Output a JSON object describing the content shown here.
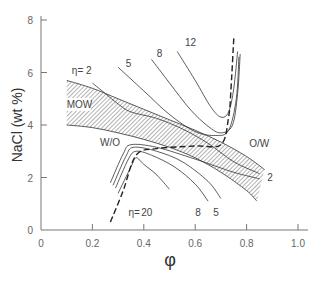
{
  "chart_data": {
    "type": "line",
    "title": "",
    "xlabel": "φ",
    "ylabel": "NaCl (wt %)",
    "xlim": [
      0,
      1.0
    ],
    "ylim": [
      0,
      8
    ],
    "grid": false,
    "x_ticks": [
      "0",
      "0.2",
      "0.4",
      "0.6",
      "0.8",
      "1.0"
    ],
    "y_ticks": [
      "0",
      "2",
      "4",
      "6",
      "8"
    ],
    "regions": [
      {
        "name": "MOW",
        "type": "hatched-band",
        "upper": [
          [
            0.1,
            5.7
          ],
          [
            0.2,
            5.4
          ],
          [
            0.3,
            5.0
          ],
          [
            0.4,
            4.6
          ],
          [
            0.5,
            4.2
          ],
          [
            0.6,
            3.8
          ],
          [
            0.7,
            3.35
          ],
          [
            0.8,
            2.8
          ],
          [
            0.87,
            2.3
          ]
        ],
        "lower": [
          [
            0.1,
            4.0
          ],
          [
            0.2,
            3.9
          ],
          [
            0.3,
            3.7
          ],
          [
            0.4,
            3.45
          ],
          [
            0.5,
            3.15
          ],
          [
            0.6,
            2.75
          ],
          [
            0.7,
            2.2
          ],
          [
            0.8,
            1.5
          ],
          [
            0.84,
            1.1
          ]
        ]
      }
    ],
    "series": [
      {
        "name": "η=2 (upper)",
        "eta": 2,
        "points": [
          [
            0.2,
            5.6
          ],
          [
            0.25,
            5.2
          ],
          [
            0.3,
            4.8
          ],
          [
            0.35,
            4.5
          ],
          [
            0.45,
            4.25
          ],
          [
            0.55,
            3.85
          ],
          [
            0.65,
            3.3
          ],
          [
            0.75,
            2.6
          ],
          [
            0.85,
            2.15
          ]
        ]
      },
      {
        "name": "η=5 (upper)",
        "eta": 5,
        "points": [
          [
            0.3,
            6.2
          ],
          [
            0.4,
            5.3
          ],
          [
            0.5,
            4.4
          ],
          [
            0.6,
            3.75
          ],
          [
            0.68,
            3.6
          ],
          [
            0.73,
            3.8
          ],
          [
            0.76,
            5.0
          ],
          [
            0.77,
            6.6
          ]
        ]
      },
      {
        "name": "η=8 (upper)",
        "eta": 8,
        "points": [
          [
            0.43,
            6.5
          ],
          [
            0.5,
            5.6
          ],
          [
            0.58,
            4.6
          ],
          [
            0.65,
            3.95
          ],
          [
            0.7,
            3.7
          ],
          [
            0.745,
            4.0
          ],
          [
            0.765,
            5.2
          ],
          [
            0.775,
            6.7
          ]
        ]
      },
      {
        "name": "η=12 (upper)",
        "eta": 12,
        "points": [
          [
            0.53,
            6.8
          ],
          [
            0.6,
            5.7
          ],
          [
            0.66,
            4.7
          ],
          [
            0.7,
            4.3
          ],
          [
            0.73,
            4.5
          ],
          [
            0.75,
            5.4
          ],
          [
            0.765,
            6.8
          ]
        ]
      },
      {
        "name": "η=20 (lower)",
        "eta": 20,
        "points": [
          [
            0.3,
            1.4
          ],
          [
            0.35,
            2.4
          ],
          [
            0.37,
            2.75
          ],
          [
            0.4,
            2.5
          ],
          [
            0.45,
            2.1
          ],
          [
            0.5,
            1.55
          ]
        ]
      },
      {
        "name": "η=8 (lower)",
        "eta": 8,
        "points": [
          [
            0.29,
            1.6
          ],
          [
            0.34,
            2.7
          ],
          [
            0.37,
            3.0
          ],
          [
            0.43,
            2.85
          ],
          [
            0.52,
            2.4
          ],
          [
            0.6,
            1.75
          ],
          [
            0.65,
            1.1
          ]
        ]
      },
      {
        "name": "η=5 (lower)",
        "eta": 5,
        "points": [
          [
            0.28,
            1.7
          ],
          [
            0.33,
            2.8
          ],
          [
            0.36,
            3.15
          ],
          [
            0.45,
            3.0
          ],
          [
            0.55,
            2.6
          ],
          [
            0.65,
            1.85
          ],
          [
            0.7,
            1.2
          ]
        ]
      },
      {
        "name": "η=2 (lower)",
        "eta": 2,
        "points": [
          [
            0.27,
            1.8
          ],
          [
            0.32,
            2.9
          ],
          [
            0.35,
            3.25
          ],
          [
            0.45,
            3.15
          ],
          [
            0.6,
            2.7
          ],
          [
            0.75,
            2.2
          ],
          [
            0.85,
            1.95
          ]
        ]
      },
      {
        "name": "phase boundary (dashed)",
        "style": "dashed",
        "points": [
          [
            0.27,
            0.3
          ],
          [
            0.32,
            1.5
          ],
          [
            0.37,
            2.85
          ],
          [
            0.45,
            3.1
          ],
          [
            0.6,
            3.2
          ],
          [
            0.7,
            3.25
          ],
          [
            0.73,
            4.3
          ],
          [
            0.74,
            5.5
          ],
          [
            0.75,
            7.3
          ]
        ]
      }
    ],
    "annotations": [
      {
        "text": "η= 2",
        "x": 0.12,
        "y": 5.95
      },
      {
        "text": "5",
        "x": 0.33,
        "y": 6.2
      },
      {
        "text": "8",
        "x": 0.45,
        "y": 6.6
      },
      {
        "text": "12",
        "x": 0.56,
        "y": 7.0
      },
      {
        "text": "MOW",
        "x": 0.1,
        "y": 4.65
      },
      {
        "text": "W/O",
        "x": 0.23,
        "y": 3.2
      },
      {
        "text": "O/W",
        "x": 0.81,
        "y": 3.15
      },
      {
        "text": "2",
        "x": 0.88,
        "y": 1.85
      },
      {
        "text": "η=",
        "x": 0.34,
        "y": 0.55
      },
      {
        "text": "20",
        "x": 0.39,
        "y": 0.55
      },
      {
        "text": "8",
        "x": 0.6,
        "y": 0.55
      },
      {
        "text": "5",
        "x": 0.67,
        "y": 0.55
      }
    ]
  }
}
